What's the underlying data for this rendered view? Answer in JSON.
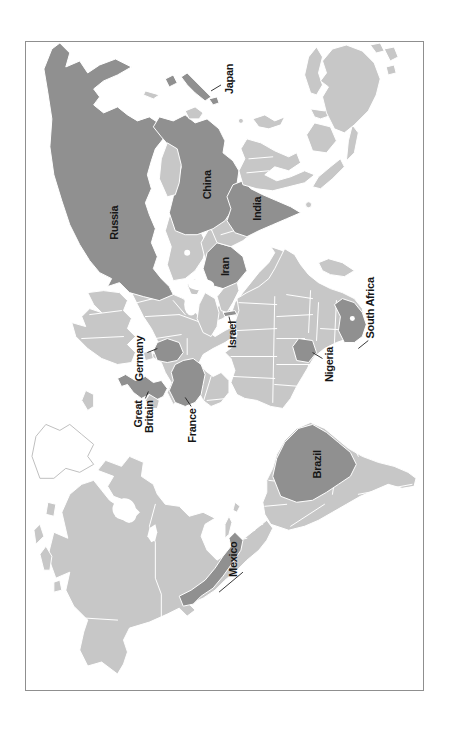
{
  "figure": {
    "type": "world-map-rotated-90ccw"
  },
  "colors": {
    "country_base": "#c7c7c7",
    "country_highlight": "#909090",
    "water": "#ffffff",
    "frame": "#8f8f8f",
    "label_text": "#161616",
    "greenland_outline": "#bfbfbf"
  },
  "labels": {
    "russia": "Russia",
    "china": "China",
    "japan": "Japan",
    "india": "India",
    "iran": "Iran",
    "israel": "Israel",
    "germany": "Germany",
    "great_britain": [
      "Great",
      "Britain"
    ],
    "france": "France",
    "nigeria": "Nigeria",
    "south_africa": "South Africa",
    "mexico": "Mexico",
    "brazil": "Brazil"
  },
  "highlighted_countries": [
    "Russia",
    "China",
    "Japan",
    "India",
    "Iran",
    "Israel",
    "Germany",
    "Great Britain",
    "France",
    "Nigeria",
    "South Africa",
    "Mexico",
    "Brazil"
  ]
}
